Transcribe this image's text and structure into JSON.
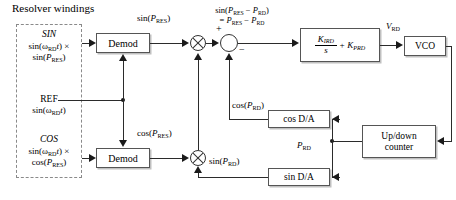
{
  "diagram": {
    "title": "Resolver windings",
    "resolver": {
      "sin_name": "SIN",
      "sin_expr_1": "sin(ωRDt) ×",
      "sin_expr_2": "sin(PRES)",
      "ref_name": "REF",
      "ref_expr": "sin(ωRDt)",
      "cos_name": "COS",
      "cos_expr_1": "sin(ωRDt) ×",
      "cos_expr_2": "cos(PRES)"
    },
    "blocks": {
      "demod_top": "Demod",
      "demod_bottom": "Demod",
      "compensator_num": "KIRD",
      "compensator_den": "s",
      "compensator_plus": "+ KPRD",
      "vco": "VCO",
      "counter_line1": "Up/down",
      "counter_line2": "counter",
      "cos_da": "cos D/A",
      "sin_da": "sin D/A"
    },
    "signals": {
      "sin_pres": "sin(PRES)",
      "cos_pres": "cos(PRES)",
      "error_line1": "sin(PRES − PRD)",
      "error_line2": "= PRES − PRD",
      "v_rd": "VRD",
      "cos_prd": "cos(PRD)",
      "sin_prd": "sin(PRD)",
      "p_rd": "PRD",
      "plus_sign": "+",
      "minus_sign": "−"
    },
    "colors": {
      "wire": "#2b2b2b",
      "box_border": "#555555",
      "dashed_border": "#8a8a8a",
      "background": "#ffffff"
    }
  }
}
